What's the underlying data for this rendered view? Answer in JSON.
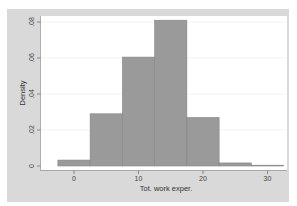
{
  "chart_data": {
    "type": "bar",
    "subtype": "histogram",
    "title": "",
    "xlabel": "Tot. work exper.",
    "ylabel": "Density",
    "bin_edges": [
      -2.5,
      2.5,
      7.5,
      12.5,
      17.5,
      22.5,
      27.5,
      32.5
    ],
    "categories": [
      "-2.5–2.5",
      "2.5–7.5",
      "7.5–12.5",
      "12.5–17.5",
      "17.5–22.5",
      "22.5–27.5",
      "27.5–32.5"
    ],
    "values": [
      0.0033,
      0.029,
      0.0605,
      0.081,
      0.027,
      0.0017,
      0.0003
    ],
    "xlim": [
      -5,
      34
    ],
    "ylim": [
      0,
      0.085
    ],
    "x_ticks": [
      0,
      10,
      20,
      30
    ],
    "x_tick_labels": [
      "0",
      "10",
      "20",
      "30"
    ],
    "y_ticks": [
      0,
      0.02,
      0.04,
      0.06,
      0.08
    ],
    "y_tick_labels": [
      "0",
      ".02",
      ".04",
      ".06",
      ".08"
    ],
    "grid": true,
    "legend": null
  },
  "colors": {
    "panel": "#d9d9d9",
    "plot_bg": "#ffffff",
    "bar_fill": "#9a9a9a",
    "bar_edge": "#858585",
    "grid": "#ececec",
    "text": "#444444"
  }
}
